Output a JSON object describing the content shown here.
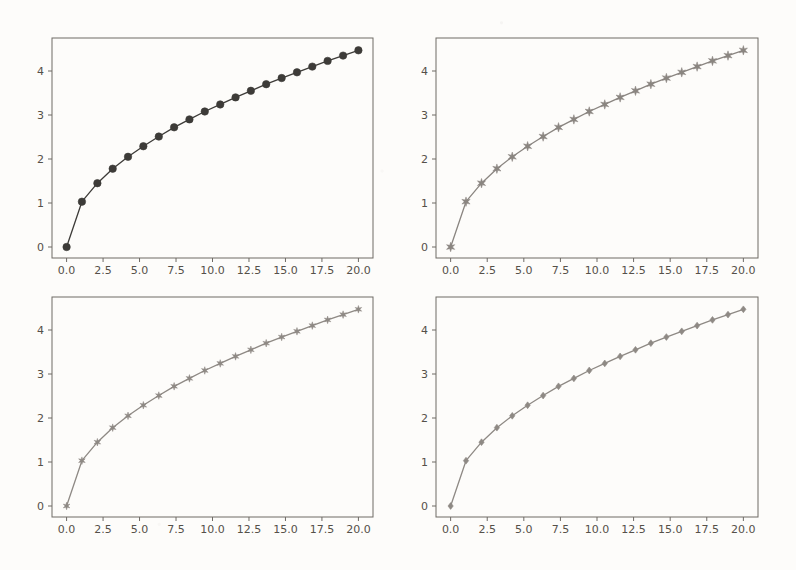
{
  "figure": {
    "background_color": "#fdfcfa",
    "layout": "2x2 subplot grid",
    "subplot_count": 4
  },
  "chart_data": [
    {
      "type": "line",
      "title": "",
      "xlabel": "",
      "ylabel": "",
      "panel": "top-left",
      "marker": "filled-circle",
      "marker_size": 6,
      "line_color": "#3d3b38",
      "marker_color": "#3d3b38",
      "xlim": [
        -1.0,
        21.0
      ],
      "ylim": [
        -0.25,
        4.75
      ],
      "xticks": [
        "0.0",
        "2.5",
        "5.0",
        "7.5",
        "10.0",
        "12.5",
        "15.0",
        "17.5",
        "20.0"
      ],
      "xtick_values": [
        0.0,
        2.5,
        5.0,
        7.5,
        10.0,
        12.5,
        15.0,
        17.5,
        20.0
      ],
      "yticks": [
        "0",
        "1",
        "2",
        "3",
        "4"
      ],
      "ytick_values": [
        0,
        1,
        2,
        3,
        4
      ],
      "grid": false,
      "legend": null,
      "x": [
        0.0,
        1.05,
        2.11,
        3.16,
        4.21,
        5.26,
        6.32,
        7.37,
        8.42,
        9.47,
        10.53,
        11.58,
        12.63,
        13.68,
        14.74,
        15.79,
        16.84,
        17.89,
        18.95,
        20.0
      ],
      "y": [
        0.0,
        1.03,
        1.45,
        1.78,
        2.05,
        2.29,
        2.51,
        2.72,
        2.9,
        3.08,
        3.24,
        3.4,
        3.55,
        3.7,
        3.84,
        3.97,
        4.1,
        4.23,
        4.35,
        4.47
      ]
    },
    {
      "type": "line",
      "title": "",
      "xlabel": "",
      "ylabel": "",
      "panel": "top-right",
      "marker": "star",
      "marker_size": 5,
      "line_color": "#8a8580",
      "marker_color": "#8a8580",
      "xlim": [
        -1.0,
        21.0
      ],
      "ylim": [
        -0.25,
        4.75
      ],
      "xticks": [
        "0.0",
        "2.5",
        "5.0",
        "7.5",
        "10.0",
        "12.5",
        "15.0",
        "17.5",
        "20.0"
      ],
      "xtick_values": [
        0.0,
        2.5,
        5.0,
        7.5,
        10.0,
        12.5,
        15.0,
        17.5,
        20.0
      ],
      "yticks": [
        "0",
        "1",
        "2",
        "3",
        "4"
      ],
      "ytick_values": [
        0,
        1,
        2,
        3,
        4
      ],
      "grid": false,
      "legend": null,
      "x": [
        0.0,
        1.05,
        2.11,
        3.16,
        4.21,
        5.26,
        6.32,
        7.37,
        8.42,
        9.47,
        10.53,
        11.58,
        12.63,
        13.68,
        14.74,
        15.79,
        16.84,
        17.89,
        18.95,
        20.0
      ],
      "y": [
        0.0,
        1.03,
        1.45,
        1.78,
        2.05,
        2.29,
        2.51,
        2.72,
        2.9,
        3.08,
        3.24,
        3.4,
        3.55,
        3.7,
        3.84,
        3.97,
        4.1,
        4.23,
        4.35,
        4.47
      ]
    },
    {
      "type": "line",
      "title": "",
      "xlabel": "",
      "ylabel": "",
      "panel": "bottom-left",
      "marker": "star",
      "marker_size": 4,
      "line_color": "#8e8984",
      "marker_color": "#8e8984",
      "xlim": [
        -1.0,
        21.0
      ],
      "ylim": [
        -0.25,
        4.75
      ],
      "xticks": [
        "0.0",
        "2.5",
        "5.0",
        "7.5",
        "10.0",
        "12.5",
        "15.0",
        "17.5",
        "20.0"
      ],
      "xtick_values": [
        0.0,
        2.5,
        5.0,
        7.5,
        10.0,
        12.5,
        15.0,
        17.5,
        20.0
      ],
      "yticks": [
        "0",
        "1",
        "2",
        "3",
        "4"
      ],
      "ytick_values": [
        0,
        1,
        2,
        3,
        4
      ],
      "grid": false,
      "legend": null,
      "x": [
        0.0,
        1.05,
        2.11,
        3.16,
        4.21,
        5.26,
        6.32,
        7.37,
        8.42,
        9.47,
        10.53,
        11.58,
        12.63,
        13.68,
        14.74,
        15.79,
        16.84,
        17.89,
        18.95,
        20.0
      ],
      "y": [
        0.0,
        1.03,
        1.45,
        1.78,
        2.05,
        2.29,
        2.51,
        2.72,
        2.9,
        3.08,
        3.24,
        3.4,
        3.55,
        3.7,
        3.84,
        3.97,
        4.1,
        4.23,
        4.35,
        4.47
      ]
    },
    {
      "type": "line",
      "title": "",
      "xlabel": "",
      "ylabel": "",
      "panel": "bottom-right",
      "marker": "diamond",
      "marker_size": 4,
      "line_color": "#8e8984",
      "marker_color": "#8e8984",
      "xlim": [
        -1.0,
        21.0
      ],
      "ylim": [
        -0.25,
        4.75
      ],
      "xticks": [
        "0.0",
        "2.5",
        "5.0",
        "7.5",
        "10.0",
        "12.5",
        "15.0",
        "17.5",
        "20.0"
      ],
      "xtick_values": [
        0.0,
        2.5,
        5.0,
        7.5,
        10.0,
        12.5,
        15.0,
        17.5,
        20.0
      ],
      "yticks": [
        "0",
        "1",
        "2",
        "3",
        "4"
      ],
      "ytick_values": [
        0,
        1,
        2,
        3,
        4
      ],
      "grid": false,
      "legend": null,
      "x": [
        0.0,
        1.05,
        2.11,
        3.16,
        4.21,
        5.26,
        6.32,
        7.37,
        8.42,
        9.47,
        10.53,
        11.58,
        12.63,
        13.68,
        14.74,
        15.79,
        16.84,
        17.89,
        18.95,
        20.0
      ],
      "y": [
        0.0,
        1.03,
        1.45,
        1.78,
        2.05,
        2.29,
        2.51,
        2.72,
        2.9,
        3.08,
        3.24,
        3.4,
        3.55,
        3.7,
        3.84,
        3.97,
        4.1,
        4.23,
        4.35,
        4.47
      ]
    }
  ],
  "panels": [
    {
      "name": "top-left",
      "x": 52,
      "y": 38,
      "w": 321,
      "h": 220
    },
    {
      "name": "top-right",
      "x": 436,
      "y": 38,
      "w": 322,
      "h": 220
    },
    {
      "name": "bottom-left",
      "x": 52,
      "y": 297,
      "w": 321,
      "h": 220
    },
    {
      "name": "bottom-right",
      "x": 436,
      "y": 297,
      "w": 322,
      "h": 220
    }
  ],
  "style": {
    "spine_color": "#6e6a65",
    "tick_color": "#6e6a65",
    "tick_label_color": "#555049",
    "plot_background": "#fdfcfa"
  }
}
